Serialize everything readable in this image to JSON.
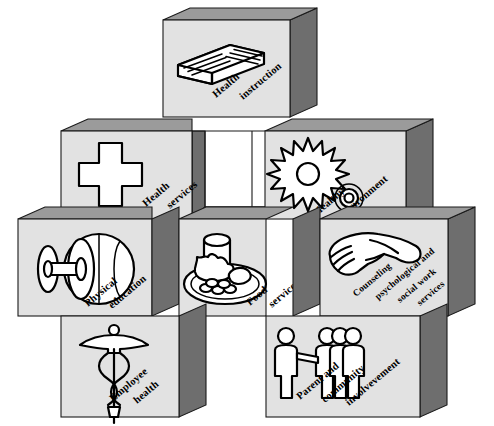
{
  "diagram": {
    "type": "isometric-block-cross",
    "block_count": 8,
    "colors": {
      "face": "#e2e2e2",
      "top_bevel": "#9b9b9b",
      "side_bevel": "#6e6e6e",
      "outline": "#1a1a1a",
      "notch": "#ffffff",
      "icon_fill": "#ffffff",
      "icon_stroke": "#000000",
      "background": "#ffffff"
    },
    "blocks": [
      {
        "id": "health-instruction",
        "icon": "book-icon",
        "label_lines": [
          "Health",
          "instruction"
        ],
        "position": "top-center"
      },
      {
        "id": "health-services",
        "icon": "medical-cross-icon",
        "label_lines": [
          "Health",
          "services"
        ],
        "position": "upper-left"
      },
      {
        "id": "healthy-environment",
        "icon": "sun-and-flower-icon",
        "label_lines": [
          "Healthy",
          "environment"
        ],
        "position": "upper-right"
      },
      {
        "id": "physical-education",
        "icon": "dumbbell-and-basketball-icon",
        "label_lines": [
          "Physical",
          "education"
        ],
        "position": "middle-left"
      },
      {
        "id": "food-services",
        "icon": "plate-of-food-icon",
        "label_lines": [
          "Food",
          "services"
        ],
        "position": "middle-center"
      },
      {
        "id": "counseling-psychological-social-work-services",
        "icon": "handshake-icon",
        "label_lines": [
          "Counseling",
          "psychological and",
          "social work",
          "services"
        ],
        "position": "middle-right"
      },
      {
        "id": "employee-health",
        "icon": "caduceus-icon",
        "label_lines": [
          "Employee",
          "health"
        ],
        "position": "lower-left"
      },
      {
        "id": "parent-and-community-involvevement",
        "icon": "people-group-icon",
        "label_lines": [
          "Parent and",
          "community",
          "involvevement"
        ],
        "position": "lower-right"
      }
    ]
  }
}
